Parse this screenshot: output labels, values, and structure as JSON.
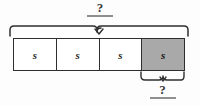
{
  "diagram": {
    "type": "tape-diagram",
    "title": "",
    "background_color": "#fdfdfd",
    "stroke_color": "#2e2e2e",
    "shaded_color": "#a9a9a9",
    "rule_color": "#8f8f8f",
    "top_brace": {
      "label": "?",
      "spans_segments": 4,
      "description": "brace spanning the whole bar"
    },
    "bottom_brace": {
      "label": "?",
      "spans_segments": 1,
      "description": "brace spanning the shaded segment only"
    },
    "segments": [
      {
        "label": "s",
        "shaded": false
      },
      {
        "label": "s",
        "shaded": false
      },
      {
        "label": "s",
        "shaded": false
      },
      {
        "label": "s",
        "shaded": true
      }
    ]
  }
}
